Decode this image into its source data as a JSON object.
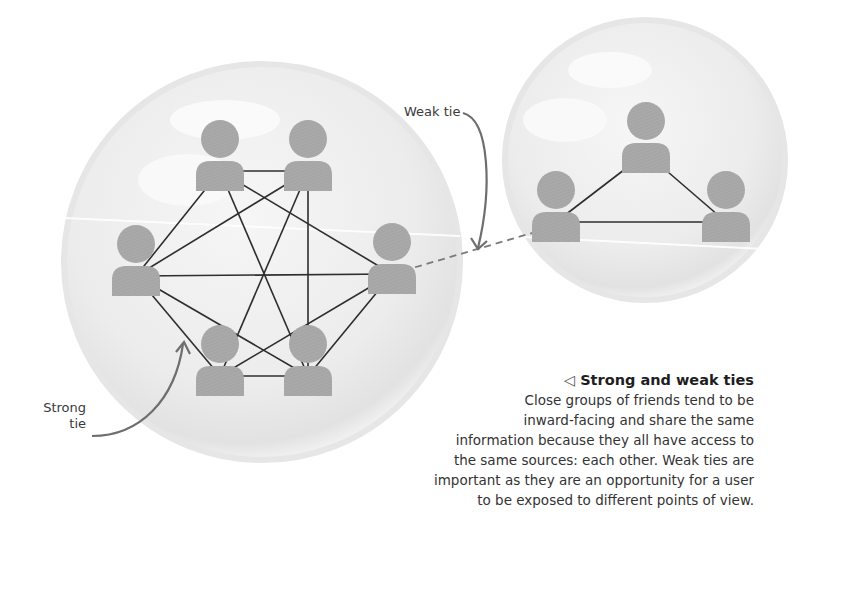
{
  "diagram": {
    "title": "Strong and weak ties",
    "title_marker": "◁",
    "caption_lines": [
      "Close groups of friends tend to be",
      "inward-facing and share the same",
      "information because they all have access to",
      "the same sources: each other. Weak ties are",
      "important as they are an opportunity for a user",
      "to be exposed to different points of view."
    ],
    "labels": {
      "weak_tie": "Weak tie",
      "strong_tie_line1": "Strong",
      "strong_tie_line2": "tie"
    },
    "colors": {
      "person": "#a9a9a9",
      "strong_edge": "#2e2e2e",
      "weak_edge": "#7a7a7a",
      "arrow": "#6e6e6e",
      "bubble": "#e9e9e9"
    },
    "groups": [
      {
        "name": "close-group",
        "people": [
          "person-1",
          "person-2",
          "person-3",
          "person-4",
          "person-5",
          "person-6"
        ],
        "strong_ties": [
          [
            0,
            1
          ],
          [
            0,
            2
          ],
          [
            0,
            3
          ],
          [
            0,
            5
          ],
          [
            1,
            4
          ],
          [
            1,
            2
          ],
          [
            1,
            5
          ],
          [
            2,
            3
          ],
          [
            2,
            4
          ],
          [
            3,
            5
          ],
          [
            4,
            5
          ],
          [
            4,
            3
          ],
          [
            0,
            4
          ]
        ]
      },
      {
        "name": "other-group",
        "people": [
          "person-7",
          "person-8",
          "person-9"
        ],
        "strong_ties": [
          [
            0,
            1
          ],
          [
            0,
            2
          ],
          [
            1,
            2
          ]
        ]
      }
    ],
    "weak_tie": {
      "from": "person-6",
      "to": "person-8"
    }
  }
}
